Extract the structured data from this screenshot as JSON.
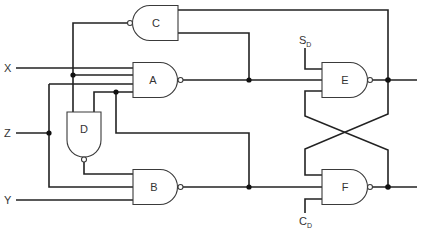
{
  "diagram": {
    "type": "logic-circuit",
    "signals": {
      "x": "X",
      "y": "Y",
      "z": "Z",
      "sd": {
        "main": "S",
        "sub": "D"
      },
      "cd": {
        "main": "C",
        "sub": "D"
      }
    },
    "gates": [
      {
        "id": "a",
        "label": "A",
        "kind": "NAND",
        "inputs": 4
      },
      {
        "id": "b",
        "label": "B",
        "kind": "NAND",
        "inputs": 3
      },
      {
        "id": "c",
        "label": "C",
        "kind": "NAND",
        "inputs": 2
      },
      {
        "id": "d",
        "label": "D",
        "kind": "NAND",
        "inputs": 2
      },
      {
        "id": "e",
        "label": "E",
        "kind": "NAND",
        "inputs": 3
      },
      {
        "id": "f",
        "label": "F",
        "kind": "NAND",
        "inputs": 3
      }
    ],
    "colors": {
      "line": "#222222",
      "background": "#ffffff"
    }
  }
}
